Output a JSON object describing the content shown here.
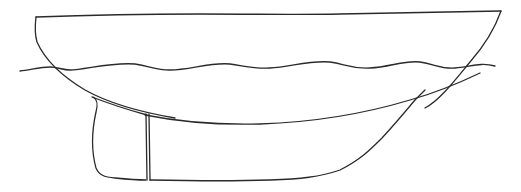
{
  "drawing": {
    "subject": "boat hull profile",
    "style": "line drawing",
    "colors": {
      "background": "#ffffff",
      "stroke": "#2a2a2a"
    },
    "parts": [
      {
        "name": "deck-line"
      },
      {
        "name": "stern"
      },
      {
        "name": "bow"
      },
      {
        "name": "waterline"
      },
      {
        "name": "hull-bottom"
      },
      {
        "name": "keel"
      },
      {
        "name": "rudder"
      }
    ]
  }
}
